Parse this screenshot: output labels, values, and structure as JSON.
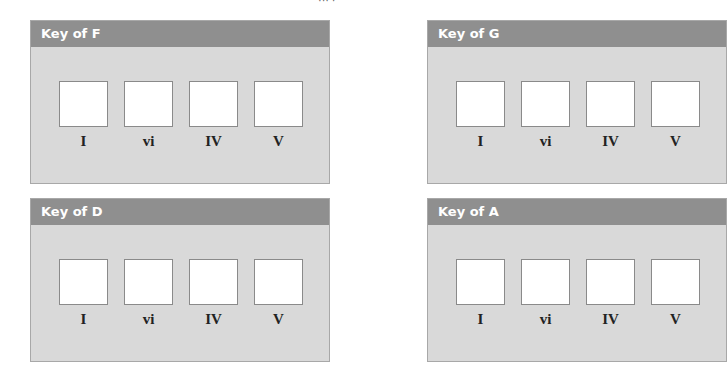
{
  "page": {
    "top_fragment": "··· ·"
  },
  "panels": [
    {
      "title": "Key of F",
      "slots": [
        {
          "label": "I"
        },
        {
          "label": "vi"
        },
        {
          "label": "IV"
        },
        {
          "label": "V"
        }
      ]
    },
    {
      "title": "Key of G",
      "slots": [
        {
          "label": "I"
        },
        {
          "label": "vi"
        },
        {
          "label": "IV"
        },
        {
          "label": "V"
        }
      ]
    },
    {
      "title": "Key of D",
      "slots": [
        {
          "label": "I"
        },
        {
          "label": "vi"
        },
        {
          "label": "IV"
        },
        {
          "label": "V"
        }
      ]
    },
    {
      "title": "Key of A",
      "slots": [
        {
          "label": "I"
        },
        {
          "label": "vi"
        },
        {
          "label": "IV"
        },
        {
          "label": "V"
        }
      ]
    }
  ],
  "colors": {
    "header_bg": "#8f8f8f",
    "panel_bg": "#d9d9d9",
    "box_bg": "#ffffff"
  }
}
